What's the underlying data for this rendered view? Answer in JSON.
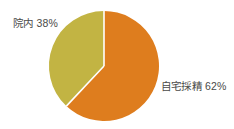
{
  "chart_data": {
    "type": "pie",
    "title": "",
    "subtitle": "",
    "xlabel": "",
    "ylabel": "",
    "legend_position": "none",
    "grid": false,
    "categories": [
      "自宅採精",
      "院内"
    ],
    "values": [
      62,
      38
    ],
    "unit": "%",
    "slices": [
      {
        "name": "自宅採精",
        "value": 62,
        "label": "自宅採精 62%",
        "color": "#DE7D1E",
        "start_angle_deg": 0,
        "end_angle_deg": 223.2
      },
      {
        "name": "院内",
        "value": 38,
        "label": "院内 38%",
        "color": "#C2B443",
        "start_angle_deg": 223.2,
        "end_angle_deg": 360
      }
    ],
    "annotations": [
      {
        "text": "院内 38%",
        "target": "院内"
      },
      {
        "text": "自宅採精 62%",
        "target": "自宅採精"
      }
    ]
  },
  "colors": {
    "background": "#FFFFFF",
    "slice_home": "#DE7D1E",
    "slice_inhouse": "#C2B443",
    "slice_divider": "#FFFFFF",
    "label_text": "#4A4A48"
  },
  "labels": {
    "inhouse": "院内 38%",
    "home": "自宅採精 62%"
  }
}
